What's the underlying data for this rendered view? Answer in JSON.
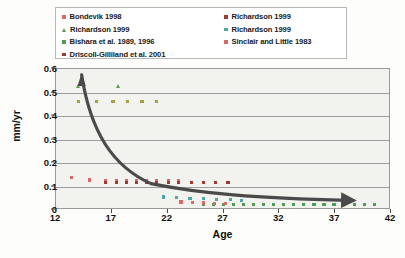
{
  "legend": {
    "columns": [
      {
        "items": [
          {
            "label": "Bondevik 1998",
            "color": "#d96a68",
            "shape": "square"
          },
          {
            "label": "Richardson 1999",
            "color": "#5a9e4e",
            "shape": "triangle"
          },
          {
            "label": "Bishara et al. 1989, 1996",
            "color": "#4f9c54",
            "shape": "square"
          },
          {
            "label": "Driscoll-Gilliland et al. 2001",
            "color": "#9e3b35",
            "shape": "square"
          }
        ]
      },
      {
        "items": [
          {
            "label": "Richardson 1999",
            "color": "#9e3b35",
            "shape": "square"
          },
          {
            "label": "Richardson 1999",
            "color": "#4fa8a8",
            "shape": "square"
          },
          {
            "label": "Sinclair and Little 1983",
            "color": "#d96a68",
            "shape": "square"
          }
        ]
      }
    ]
  },
  "chart_data": {
    "type": "scatter",
    "title": "",
    "xlabel": "Age",
    "ylabel": "mm/yr",
    "xlim": [
      12,
      42
    ],
    "ylim": [
      0,
      0.6
    ],
    "xticks": [
      12,
      17,
      22,
      27,
      32,
      37,
      42
    ],
    "yticks": [
      "0",
      "0.1",
      "0.2",
      "0.3",
      "0.4",
      "0.5",
      "0.6"
    ],
    "ytick_values": [
      0,
      0.1,
      0.2,
      0.3,
      0.4,
      0.5,
      0.6
    ],
    "grid": "horizontal",
    "legend_position": "above-plot",
    "plot_background": "#f2f2ef",
    "series": [
      {
        "name": "Bondevik 1998",
        "color": "#d96a68",
        "shape": "square",
        "points": [
          [
            13.4,
            0.138
          ],
          [
            15.0,
            0.128
          ],
          [
            16.4,
            0.127
          ],
          [
            17.4,
            0.127
          ],
          [
            18.3,
            0.127
          ],
          [
            19.2,
            0.127
          ],
          [
            20.1,
            0.127
          ],
          [
            21.0,
            0.127
          ],
          [
            22.1,
            0.127
          ],
          [
            23.0,
            0.127
          ]
        ]
      },
      {
        "name": "Richardson 1999 (triangles)",
        "color": "#5a9e4e",
        "shape": "triangle",
        "points": [
          [
            14.0,
            0.525
          ],
          [
            17.6,
            0.525
          ]
        ]
      },
      {
        "name": "Bishara et al. 1989, 1996",
        "color": "#4f9c54",
        "shape": "square",
        "points": [
          [
            25.2,
            0.022
          ],
          [
            26.1,
            0.022
          ],
          [
            27.0,
            0.022
          ],
          [
            27.9,
            0.022
          ],
          [
            28.8,
            0.022
          ],
          [
            29.7,
            0.022
          ],
          [
            30.6,
            0.022
          ],
          [
            31.5,
            0.022
          ],
          [
            32.4,
            0.022
          ],
          [
            33.3,
            0.022
          ],
          [
            34.2,
            0.022
          ],
          [
            35.1,
            0.022
          ],
          [
            36.0,
            0.022
          ],
          [
            36.9,
            0.022
          ],
          [
            37.8,
            0.022
          ],
          [
            38.7,
            0.022
          ],
          [
            39.6,
            0.022
          ],
          [
            40.5,
            0.022
          ]
        ]
      },
      {
        "name": "Driscoll-Gilliland et al. 2001",
        "color": "#9e3b35",
        "shape": "square",
        "points": [
          [
            16.4,
            0.118
          ],
          [
            17.4,
            0.118
          ],
          [
            18.3,
            0.118
          ],
          [
            19.2,
            0.118
          ],
          [
            20.1,
            0.118
          ],
          [
            21.0,
            0.118
          ],
          [
            22.1,
            0.118
          ],
          [
            23.0,
            0.118
          ],
          [
            24.1,
            0.118
          ],
          [
            25.2,
            0.118
          ],
          [
            26.3,
            0.118
          ],
          [
            27.4,
            0.118
          ]
        ]
      },
      {
        "name": "Richardson 1999 (olive row)",
        "color": "#a8a03a",
        "shape": "square",
        "points": [
          [
            14.0,
            0.46
          ],
          [
            15.6,
            0.46
          ],
          [
            17.1,
            0.46
          ],
          [
            18.4,
            0.46
          ],
          [
            19.7,
            0.46
          ],
          [
            21.0,
            0.46
          ]
        ]
      },
      {
        "name": "Richardson 1999 (teal)",
        "color": "#4fa8a8",
        "shape": "square",
        "points": [
          [
            21.6,
            0.055
          ],
          [
            22.8,
            0.052
          ],
          [
            24.0,
            0.05
          ],
          [
            25.2,
            0.048
          ],
          [
            26.4,
            0.046
          ],
          [
            27.6,
            0.044
          ],
          [
            28.6,
            0.042
          ]
        ]
      },
      {
        "name": "Sinclair and Little 1983",
        "color": "#d96a68",
        "shape": "square",
        "points": [
          [
            23.2,
            0.034
          ],
          [
            24.2,
            0.032
          ],
          [
            25.2,
            0.03
          ],
          [
            26.2,
            0.029
          ],
          [
            27.2,
            0.028
          ]
        ]
      }
    ],
    "annotation": {
      "type": "curved-arrow",
      "color": "#4a4a4a",
      "description": "Thick double-headed decaying curve: arrow up at left near age 14 rising to 0.57, steeply falling, flattening near 0.03 and arrow pointing right near age 38.5"
    }
  }
}
